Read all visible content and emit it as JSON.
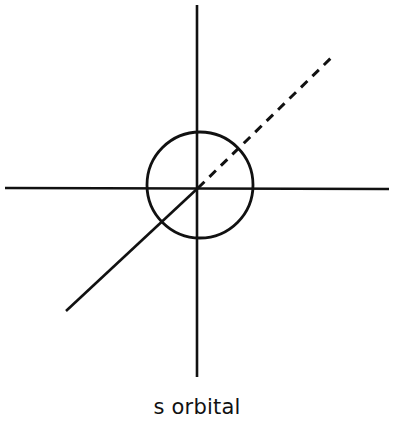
{
  "diagram": {
    "title": "s orbital",
    "caption": "s orbital",
    "stroke_color": "#111111",
    "background": "#ffffff",
    "axes": {
      "vertical": {
        "x1": 197,
        "y1": 5,
        "x2": 197,
        "y2": 377
      },
      "horizontal": {
        "x1": 5,
        "y1": 188,
        "x2": 389,
        "y2": 189
      },
      "diagonal_solid": {
        "x1": 197,
        "y1": 188,
        "x2": 66,
        "y2": 311
      },
      "diagonal_dashed": {
        "x1": 197,
        "y1": 188,
        "x2": 332,
        "y2": 57
      }
    },
    "orbital": {
      "shape": "sphere",
      "cx": 200,
      "cy": 185,
      "r": 53
    }
  }
}
